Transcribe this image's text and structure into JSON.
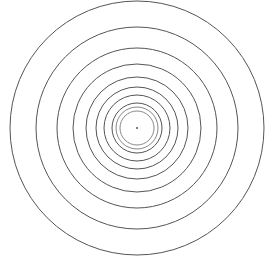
{
  "diagram": {
    "type": "concentric-circles",
    "center": {
      "x": 137,
      "y": 128
    },
    "stroke_color": "#555555",
    "inner_stroke_color": "#888888",
    "background": "#ffffff",
    "radii": [
      127,
      101,
      80,
      64,
      51,
      41,
      33,
      25,
      21,
      17
    ],
    "center_dot_radius": 1
  }
}
